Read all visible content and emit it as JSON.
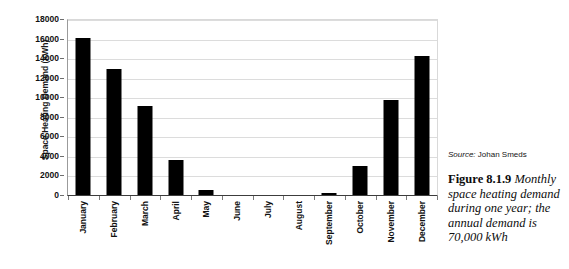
{
  "chart_data": {
    "type": "bar",
    "title": "",
    "xlabel": "",
    "ylabel": "Space Heating Demand (kWh)",
    "categories": [
      "January",
      "February",
      "March",
      "April",
      "May",
      "June",
      "July",
      "August",
      "September",
      "October",
      "November",
      "December"
    ],
    "values": [
      16100,
      12900,
      9100,
      3550,
      500,
      0,
      0,
      0,
      200,
      2950,
      9750,
      14200
    ],
    "ylim": [
      0,
      18000
    ],
    "ytick_values": [
      0,
      2000,
      4000,
      6000,
      8000,
      10000,
      12000,
      14000,
      16000,
      18000
    ],
    "ytick_labels": [
      "0",
      "2000",
      "4000",
      "6000",
      "8000",
      "10000",
      "12000",
      "14000",
      "16000",
      "18000"
    ],
    "grid": true,
    "legend": false,
    "bar_color": "#000000",
    "gridline_color": "#dcdcdc",
    "axis_color": "#3c3c3c"
  },
  "caption": {
    "source_label": "Source:",
    "source_name": "Johan Smeds",
    "figure_number": "Figure 8.1.9",
    "figure_text": " Monthly space heating demand during one year; the annual demand is 70,000 kWh"
  }
}
